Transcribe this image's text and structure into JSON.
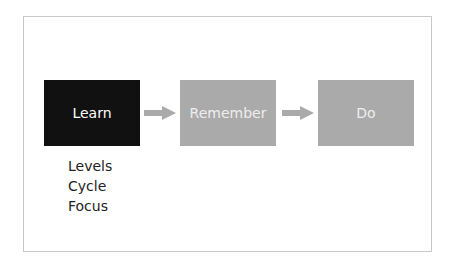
{
  "diagram": {
    "steps": [
      {
        "label": "Learn",
        "color": "#111111"
      },
      {
        "label": "Remember",
        "color": "#aaaaaa"
      },
      {
        "label": "Do",
        "color": "#aaaaaa"
      }
    ],
    "arrow_color": "#aaaaaa",
    "learn_details": [
      "Levels",
      "Cycle",
      "Focus"
    ]
  }
}
